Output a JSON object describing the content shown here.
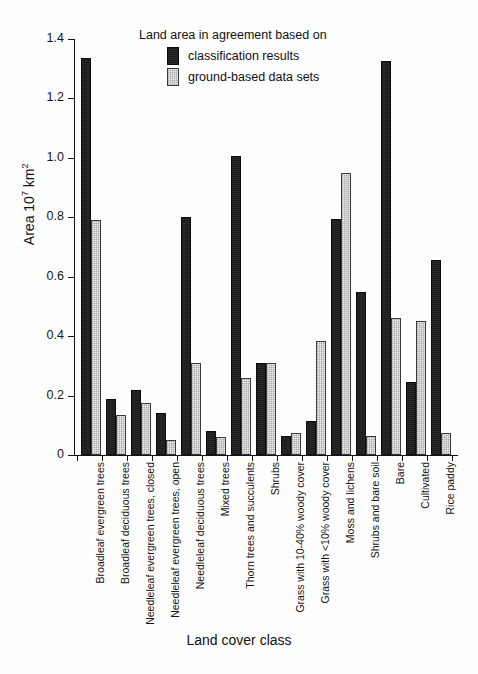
{
  "chart_data": {
    "type": "bar",
    "title": "",
    "xlabel": "Land cover class",
    "ylabel": "Area 10⁷ km²",
    "ylabel_parts": {
      "prefix": "Area 10",
      "exponent": "7",
      "suffix": " km",
      "unit_exponent": "2"
    },
    "ylim": [
      0,
      1.4
    ],
    "yticks": [
      0,
      0.2,
      0.4,
      0.6,
      0.8,
      1.0,
      1.2,
      1.4
    ],
    "ytick_labels": [
      "0",
      "0.2",
      "0.4",
      "0.6",
      "0.8",
      "1.0",
      "1.2",
      "1.4"
    ],
    "grid": false,
    "legend_position": "top-center",
    "legend_title": "Land area in agreement based on",
    "categories": [
      "Broadleaf evergreen trees",
      "Broadleaf deciduous trees",
      "Needleleaf evergreen trees, closed",
      "Needleleaf evergreen trees, open",
      "Needleleaf deciduous trees",
      "Mixed trees",
      "Thorn trees and succulents",
      "Shrubs",
      "Grass with 10-40% woody cover",
      "Grass with <10% woody cover",
      "Moss and lichens",
      "Shrubs and bare soil",
      "Bare",
      "Cultivated",
      "Rice paddy"
    ],
    "series": [
      {
        "name": "classification results",
        "color": "#1c1c1c",
        "values": [
          1.335,
          0.19,
          0.22,
          0.14,
          0.8,
          0.08,
          1.005,
          0.31,
          0.065,
          0.115,
          0.795,
          0.55,
          1.325,
          0.245,
          0.655
        ]
      },
      {
        "name": "ground-based data sets",
        "color": "#ececec",
        "values": [
          0.79,
          0.135,
          0.175,
          0.05,
          0.31,
          0.06,
          0.26,
          0.31,
          0.075,
          0.385,
          0.95,
          0.065,
          0.46,
          0.45,
          0.075
        ]
      }
    ]
  }
}
